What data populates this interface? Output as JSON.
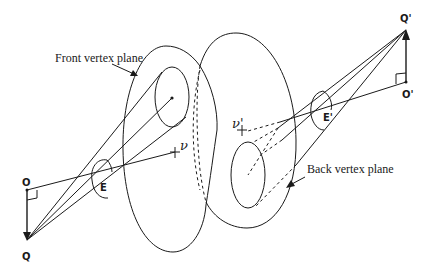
{
  "labels": {
    "front_plane": "Front vertex plane",
    "back_plane": "Back vertex plane",
    "point_Q": "Q",
    "point_O": "O",
    "point_Q_prime": "Q'",
    "point_O_prime": "O'",
    "point_E": "E",
    "point_E_prime": "E'",
    "point_nu": "ν",
    "point_nu_prime": "ν'"
  },
  "colors": {
    "stroke": "#1a1a1a",
    "background": "#ffffff"
  }
}
